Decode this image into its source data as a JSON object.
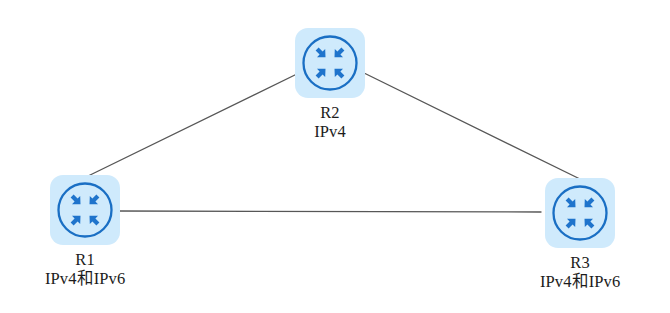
{
  "diagram": {
    "type": "network-topology",
    "background_color": "#ffffff",
    "link_color": "#575757",
    "icon_tile_color": "#cfeafc",
    "icon_stroke_color": "#1a6fc4",
    "label_color": "#1c1c1c",
    "nodes": [
      {
        "id": "r2",
        "name": "R2",
        "protocol": "IPv4",
        "icon": "router-icon",
        "x": 295,
        "y": 28
      },
      {
        "id": "r1",
        "name": "R1",
        "protocol": "IPv4和IPv6",
        "icon": "router-icon",
        "x": 45,
        "y": 175
      },
      {
        "id": "r3",
        "name": "R3",
        "protocol": "IPv4和IPv6",
        "icon": "router-icon",
        "x": 540,
        "y": 178
      }
    ],
    "links": [
      {
        "id": "link-r1-r2",
        "from": "R1",
        "to": "R2",
        "x1": 84,
        "y1": 178,
        "x2": 301,
        "y2": 72
      },
      {
        "id": "link-r2-r3",
        "from": "R2",
        "to": "R3",
        "x1": 362,
        "y1": 72,
        "x2": 582,
        "y2": 180
      },
      {
        "id": "link-r1-r3",
        "from": "R1",
        "to": "R3",
        "x1": 117,
        "y1": 211,
        "x2": 541,
        "y2": 212
      }
    ]
  }
}
